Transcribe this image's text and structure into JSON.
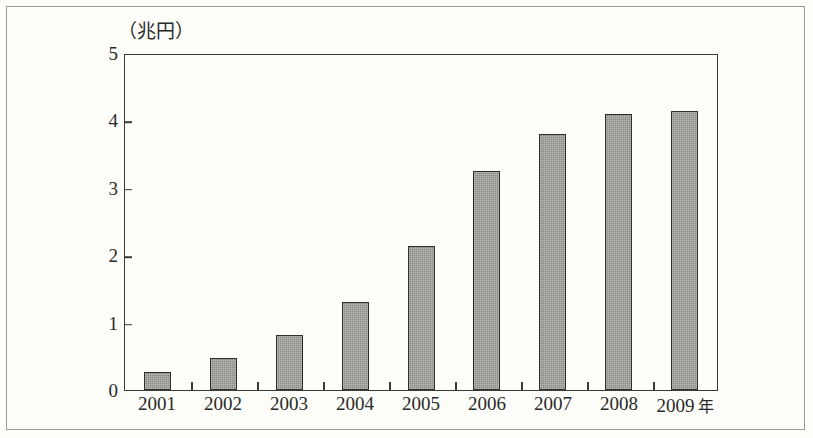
{
  "chart_data": {
    "type": "bar",
    "title": "",
    "subtitle": "",
    "xlabel": "年",
    "ylabel": "（兆円）",
    "categories": [
      "2001",
      "2002",
      "2003",
      "2004",
      "2005",
      "2006",
      "2007",
      "2008",
      "2009"
    ],
    "values": [
      0.27,
      0.48,
      0.81,
      1.3,
      2.14,
      3.25,
      3.8,
      4.1,
      4.14
    ],
    "ylim": [
      0,
      5
    ],
    "ytick_labels": [
      "0",
      "1",
      "2",
      "3",
      "4",
      "5"
    ],
    "ytick_values": [
      0,
      1,
      2,
      3,
      4,
      5
    ],
    "grid": false,
    "legend": null,
    "series": [
      {
        "name": "",
        "values": [
          0.27,
          0.48,
          0.81,
          1.3,
          2.14,
          3.25,
          3.8,
          4.1,
          4.14
        ]
      }
    ],
    "annotations": [],
    "colors": {
      "bar_fill": "#8b8b85",
      "bar_border": "#2e2e2b",
      "axis": "#3a3a37",
      "text": "#2a2a28",
      "background": "#fdfdfa",
      "frame": "#9a9a90"
    }
  },
  "axis_unit_suffix": "年"
}
